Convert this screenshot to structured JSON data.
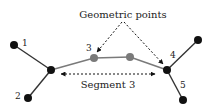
{
  "diagram": {
    "annotations": {
      "geometric_points": "Geometric points",
      "segment": "Segment 3"
    },
    "node_labels": {
      "n1": "1",
      "n2": "2",
      "n3": "3",
      "n4": "4",
      "n5": "5"
    },
    "colors": {
      "node": "#111111",
      "geometric_point": "#7a7a7a",
      "line": "#333333",
      "segment_line": "#7a7a7a"
    }
  }
}
